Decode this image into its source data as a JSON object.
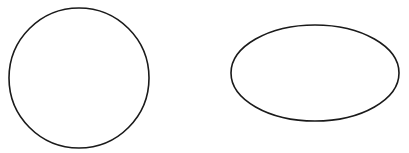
{
  "canvas": {
    "width": 409,
    "height": 153,
    "background": "#ffffff"
  },
  "shapes": [
    {
      "type": "circle",
      "cx": 79,
      "cy": 78,
      "r": 70,
      "stroke": "#1a1a1a",
      "stroke_width": 1.6,
      "fill": "none"
    },
    {
      "type": "ellipse",
      "cx": 315,
      "cy": 73,
      "rx": 84,
      "ry": 48,
      "stroke": "#1a1a1a",
      "stroke_width": 1.6,
      "fill": "none"
    }
  ]
}
